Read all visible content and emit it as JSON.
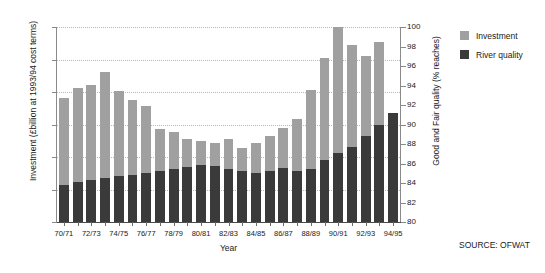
{
  "chart_data": {
    "type": "bar",
    "subtype": "overlaid-dual-axis-bar",
    "title": "",
    "xlabel": "Year",
    "ylabel": "Investment (£billion at 1993/94 cost terms)",
    "ylabel_right": "Good and Fair quality (% reaches)",
    "ylim": [
      0,
      3
    ],
    "yticks": [
      "0",
      "0.5",
      "1",
      "1.5",
      "2",
      "2.5",
      "3"
    ],
    "ytick_values": [
      0,
      0.5,
      1,
      1.5,
      2,
      2.5,
      3
    ],
    "ylim_right": [
      80,
      100
    ],
    "yticks_right": [
      "80",
      "82",
      "84",
      "86",
      "88",
      "90",
      "92",
      "94",
      "96",
      "98",
      "100"
    ],
    "ytick_values_right": [
      80,
      82,
      84,
      86,
      88,
      90,
      92,
      94,
      96,
      98,
      100
    ],
    "grid": true,
    "grid_axis": "y",
    "legend_position": "right",
    "source": "SOURCE: OFWAT",
    "categories": [
      "70/71",
      "71/72",
      "72/73",
      "73/74",
      "74/75",
      "75/76",
      "76/77",
      "77/78",
      "78/79",
      "79/80",
      "80/81",
      "81/82",
      "82/83",
      "83/84",
      "84/85",
      "85/86",
      "86/87",
      "87/88",
      "88/89",
      "89/90",
      "90/91",
      "91/92",
      "92/93",
      "93/94",
      "94/95"
    ],
    "xtick_labels_shown": [
      "70/71",
      "72/73",
      "74/75",
      "76/77",
      "78/79",
      "80/81",
      "82/83",
      "84/85",
      "86/87",
      "88/89",
      "90/91",
      "92/93",
      "94/95"
    ],
    "series": [
      {
        "name": "Investment",
        "color": "#a0a0a0",
        "axis": "left",
        "unit": "£billion at 1993/94 cost terms",
        "values": [
          1.91,
          2.06,
          2.11,
          2.31,
          2.02,
          1.88,
          1.78,
          1.43,
          1.38,
          1.27,
          1.25,
          1.21,
          1.28,
          1.14,
          1.21,
          1.33,
          1.44,
          1.58,
          2.03,
          2.52,
          3.0,
          2.72,
          2.55,
          2.77,
          1.68
        ]
      },
      {
        "name": "River quality",
        "color": "#3a3a3a",
        "axis": "right",
        "unit": "% reaches Good and Fair quality",
        "values_left_scale": [
          0.57,
          0.61,
          0.64,
          0.68,
          0.71,
          0.73,
          0.76,
          0.78,
          0.81,
          0.85,
          0.87,
          0.86,
          0.82,
          0.78,
          0.76,
          0.79,
          0.83,
          0.79,
          0.81,
          0.96,
          1.06,
          1.15,
          1.33,
          1.5,
          1.68
        ],
        "values": [
          85.8,
          86.2,
          86.6,
          87.0,
          87.3,
          87.5,
          87.8,
          88.0,
          88.3,
          88.7,
          88.9,
          88.8,
          88.4,
          88.0,
          87.8,
          88.1,
          88.5,
          88.1,
          88.3,
          89.8,
          90.9,
          91.8,
          93.6,
          95.4,
          97.2
        ]
      }
    ]
  },
  "axes": {
    "x_title": "Year",
    "y_left_title": "Investment (£billion at 1993/94 cost terms)",
    "y_right_title": "Good and Fair quality (% reaches)"
  },
  "legend": {
    "items": [
      {
        "label": "Investment",
        "color": "#a0a0a0"
      },
      {
        "label": "River quality",
        "color": "#3a3a3a"
      }
    ]
  },
  "footer": {
    "source": "SOURCE: OFWAT"
  },
  "colors": {
    "investment": "#a0a0a0",
    "river_quality": "#3a3a3a",
    "grid": "#b8b8b8",
    "axis": "#8a8a8a",
    "background": "#ffffff"
  }
}
